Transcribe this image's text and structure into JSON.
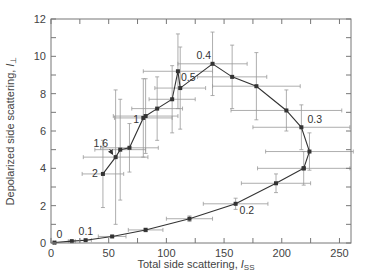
{
  "chart_data": {
    "type": "scatter",
    "title": "",
    "xlabel": "Total side scattering, I_SS",
    "xlabel_main": "Total side scattering, ",
    "xlabel_italic": "I",
    "xlabel_sub": "SS",
    "ylabel": "Depolarized side scattering, I_⊥",
    "ylabel_main": "Depolarized side scattering, ",
    "ylabel_italic": "I",
    "ylabel_sub": "⊥",
    "xlim": [
      0,
      260
    ],
    "ylim": [
      0,
      12
    ],
    "xticks": [
      0,
      50,
      100,
      150,
      200,
      250
    ],
    "xtick_labels": [
      "0",
      "50",
      "100",
      "150",
      "200",
      "250"
    ],
    "yticks": [
      0,
      2,
      4,
      6,
      8,
      10,
      12
    ],
    "ytick_labels": [
      "0",
      "2",
      "4",
      "6",
      "8",
      "10",
      "12"
    ],
    "grid": false,
    "legend": null,
    "series": [
      {
        "name": "upper branch",
        "style": "line-with-square-markers",
        "points": [
          {
            "x": 45,
            "y": 3.7,
            "xerr": 18,
            "yerr": 1.8
          },
          {
            "x": 56,
            "y": 4.6,
            "xerr": 28,
            "yerr": 3.6
          },
          {
            "x": 60,
            "y": 5.0,
            "xerr": 22,
            "yerr": 2.7
          },
          {
            "x": 68,
            "y": 5.1,
            "xerr": 25,
            "yerr": 1.3
          },
          {
            "x": 80,
            "y": 6.7,
            "xerr": 25,
            "yerr": 2.1
          },
          {
            "x": 82,
            "y": 6.8,
            "xerr": 28,
            "yerr": 2.0
          },
          {
            "x": 92,
            "y": 7.2,
            "xerr": 22,
            "yerr": 1.7
          },
          {
            "x": 105,
            "y": 7.7,
            "xerr": 20,
            "yerr": 1.8
          },
          {
            "x": 110,
            "y": 9.2,
            "xerr": 30,
            "yerr": 2.0
          },
          {
            "x": 112,
            "y": 8.3,
            "xerr": 22,
            "yerr": 2.2
          },
          {
            "x": 140,
            "y": 9.6,
            "xerr": 30,
            "yerr": 1.7
          },
          {
            "x": 157,
            "y": 8.9,
            "xerr": 30,
            "yerr": 1.7
          },
          {
            "x": 178,
            "y": 8.4,
            "xerr": 38,
            "yerr": 1.8
          },
          {
            "x": 204,
            "y": 7.1,
            "xerr": 48,
            "yerr": 1.1
          },
          {
            "x": 217,
            "y": 6.2,
            "xerr": 42,
            "yerr": 1.2
          },
          {
            "x": 224,
            "y": 4.9,
            "xerr": 38,
            "yerr": 1.0
          },
          {
            "x": 219,
            "y": 4.0,
            "xerr": 40,
            "yerr": 0.9
          }
        ]
      },
      {
        "name": "lower branch",
        "style": "line-with-square-markers",
        "points": [
          {
            "x": 219,
            "y": 4.0
          },
          {
            "x": 195,
            "y": 3.2,
            "xerr": 30,
            "yerr": 0.5
          },
          {
            "x": 160,
            "y": 2.1,
            "xerr": 28,
            "yerr": 0.3
          },
          {
            "x": 120,
            "y": 1.3,
            "xerr": 20,
            "yerr": 0.15
          },
          {
            "x": 82,
            "y": 0.7,
            "xerr": 15,
            "yerr": 0.1
          },
          {
            "x": 53,
            "y": 0.35,
            "xerr": 12,
            "yerr": 0.05
          },
          {
            "x": 30,
            "y": 0.15,
            "xerr": 5,
            "yerr": 0.03
          },
          {
            "x": 18,
            "y": 0.1,
            "xerr": 3,
            "yerr": 0.02
          },
          {
            "x": 3,
            "y": 0.02,
            "xerr": 1,
            "yerr": 0.01
          }
        ]
      }
    ],
    "annotations": [
      {
        "text": "0",
        "x": 3,
        "y": 0.02,
        "dx": 2,
        "dy": -5
      },
      {
        "text": "0.1",
        "x": 30,
        "y": 0.15,
        "dx": -7,
        "dy": -5
      },
      {
        "text": "0.2",
        "x": 160,
        "y": 2.1,
        "dx": 4,
        "dy": 10
      },
      {
        "text": "0.3",
        "x": 217,
        "y": 6.2,
        "dx": 6,
        "dy": -4
      },
      {
        "text": "0.4",
        "x": 140,
        "y": 9.6,
        "dx": -16,
        "dy": -5
      },
      {
        "text": "0.5",
        "x": 110,
        "y": 9.2,
        "dx": 3,
        "dy": 10
      },
      {
        "text": "1",
        "x": 80,
        "y": 6.7,
        "dx": -10,
        "dy": 5
      },
      {
        "text": "1.6",
        "x": 56,
        "y": 4.6,
        "dx": -22,
        "dy": -10,
        "arrow": true
      },
      {
        "text": "2",
        "x": 45,
        "y": 3.7,
        "dx": -11,
        "dy": 3
      }
    ]
  }
}
